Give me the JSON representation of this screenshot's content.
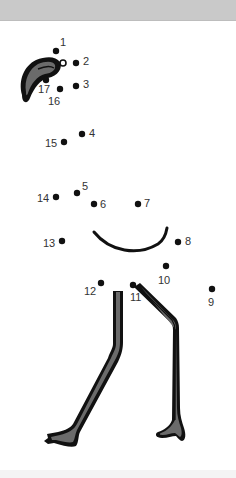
{
  "worksheet": {
    "type": "connect-the-dots",
    "subject": "flamingo",
    "colors": {
      "outline": "#111111",
      "fill": "#6b6b6b",
      "dot": "#111111",
      "label": "#333333",
      "band": "#c9c9c9"
    },
    "dots": [
      {
        "n": "1",
        "x": 56,
        "y": 51,
        "lx": 60,
        "ly": 37
      },
      {
        "n": "2",
        "x": 76,
        "y": 63,
        "lx": 83,
        "ly": 56
      },
      {
        "n": "3",
        "x": 76,
        "y": 86,
        "lx": 83,
        "ly": 79
      },
      {
        "n": "4",
        "x": 82,
        "y": 134,
        "lx": 89,
        "ly": 128
      },
      {
        "n": "5",
        "x": 77,
        "y": 193,
        "lx": 82,
        "ly": 181
      },
      {
        "n": "6",
        "x": 94,
        "y": 204,
        "lx": 100,
        "ly": 199
      },
      {
        "n": "7",
        "x": 138,
        "y": 204,
        "lx": 144,
        "ly": 198
      },
      {
        "n": "8",
        "x": 178,
        "y": 242,
        "lx": 185,
        "ly": 236
      },
      {
        "n": "9",
        "x": 212,
        "y": 289,
        "lx": 208,
        "ly": 297
      },
      {
        "n": "10",
        "x": 166,
        "y": 266,
        "lx": 158,
        "ly": 275
      },
      {
        "n": "11",
        "x": 133,
        "y": 285,
        "lx": 130,
        "ly": 292
      },
      {
        "n": "12",
        "x": 101,
        "y": 283,
        "lx": 84,
        "ly": 286
      },
      {
        "n": "13",
        "x": 62,
        "y": 241,
        "lx": 43,
        "ly": 238
      },
      {
        "n": "14",
        "x": 56,
        "y": 197,
        "lx": 37,
        "ly": 193
      },
      {
        "n": "15",
        "x": 64,
        "y": 142,
        "lx": 45,
        "ly": 138
      },
      {
        "n": "16",
        "x": 60,
        "y": 89,
        "lx": 48,
        "ly": 96
      },
      {
        "n": "17",
        "x": 46,
        "y": 80,
        "lx": 38,
        "ly": 84
      }
    ]
  }
}
